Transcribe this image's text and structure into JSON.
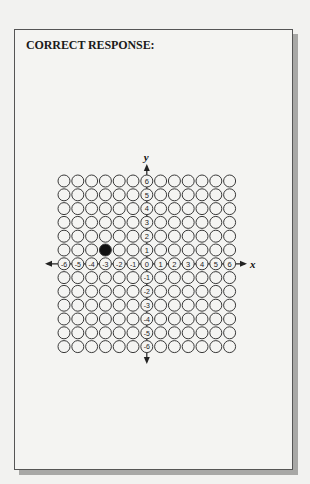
{
  "title": "CORRECT RESPONSE:",
  "axes": {
    "x_label": "x",
    "y_label": "y",
    "x_ticks": [
      "-6",
      "-5",
      "-4",
      "-3",
      "-2",
      "-1",
      "0",
      "1",
      "2",
      "3",
      "4",
      "5",
      "6"
    ],
    "y_ticks": [
      "6",
      "5",
      "4",
      "3",
      "2",
      "1",
      "0",
      "-1",
      "-2",
      "-3",
      "-4",
      "-5",
      "-6"
    ]
  },
  "grid": {
    "min": -6,
    "max": 6,
    "selected_point": {
      "x": -3,
      "y": 1
    }
  },
  "colors": {
    "stroke": "#3a3a3a",
    "fill_selected": "#111111",
    "background": "#f4f4f2"
  }
}
